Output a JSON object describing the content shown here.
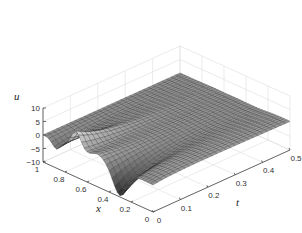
{
  "chart_data": {
    "type": "surface3d",
    "title": "",
    "xlabel": "x",
    "ylabel": "t",
    "zlabel": "u",
    "x_range": [
      0,
      1
    ],
    "t_range": [
      0,
      0.5
    ],
    "z_range": [
      -10,
      10
    ],
    "x_ticks": [
      "0",
      "0.2",
      "0.4",
      "0.6",
      "0.8",
      "1"
    ],
    "t_ticks": [
      "0",
      "0.1",
      "0.2",
      "0.3",
      "0.4",
      "0.5"
    ],
    "z_ticks": [
      "-10",
      "-5",
      "0",
      "5",
      "10"
    ],
    "grid": true,
    "colormap": "grayscale",
    "features": [
      {
        "description": "peak near t=0, x~0.7",
        "x": 0.7,
        "t": 0.0,
        "u": 5.5
      },
      {
        "description": "trough near t=0, x~0.3",
        "x": 0.3,
        "t": 0.0,
        "u": -9.5
      },
      {
        "description": "small trough near t=0, x~0.9",
        "x": 0.9,
        "t": 0.0,
        "u": -3
      },
      {
        "description": "surface decays toward 0 as t increases",
        "x": 0.5,
        "t": 0.5,
        "u": 0
      }
    ]
  },
  "labels": {
    "u": "u",
    "x": "x",
    "t": "t"
  }
}
